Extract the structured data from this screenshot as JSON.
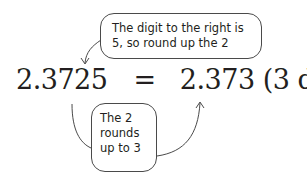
{
  "equation": {
    "original": "2.3725",
    "equals": "=",
    "rounded": "2.373",
    "precision": "(3 d.p.)"
  },
  "callouts": {
    "top": {
      "lines": [
        "The digit to the right is",
        "5, so round up the 2"
      ]
    },
    "bottom": {
      "lines": [
        "The 2",
        "rounds",
        "up to 3"
      ]
    }
  },
  "colors": {
    "text": "#231f20",
    "stroke": "#4a4a4a"
  }
}
